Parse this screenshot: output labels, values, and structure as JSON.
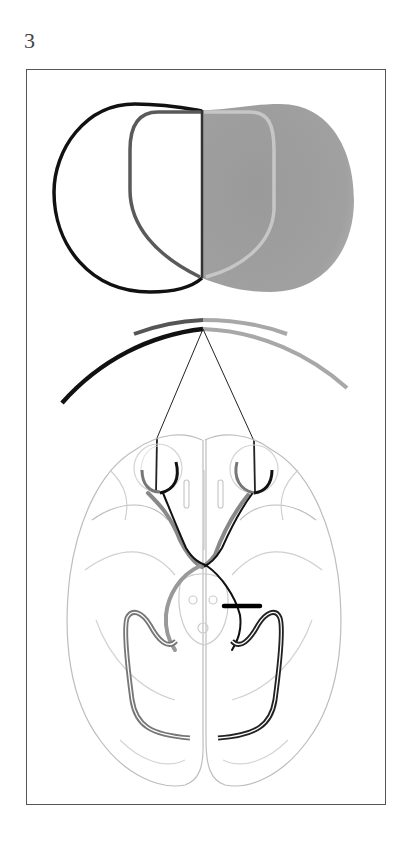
{
  "figure": {
    "label": "3"
  },
  "colors": {
    "frame": "#555555",
    "left_field_outer": "#111111",
    "left_field_inner": "#5a5a5a",
    "right_field_fill": "#9c9c9c",
    "right_field_inner": "#c4c4c4",
    "arc_dark": "#111111",
    "arc_mid": "#555555",
    "arc_light": "#a8a8a8",
    "brain_outline": "#bdbdbd",
    "pathway_dark": "#111111",
    "pathway_gray": "#777777",
    "lesion_bar": "#000000"
  },
  "elements": {
    "visual_field": "binocular visual field",
    "field_arcs": "visual field arcs",
    "sight_lines": "lines of sight",
    "eyes": [
      "left eye",
      "right eye"
    ],
    "optic_chiasm": "optic chiasm",
    "lesion": "optic tract lesion",
    "optic_radiations": [
      "left optic radiation",
      "right optic radiation"
    ]
  }
}
